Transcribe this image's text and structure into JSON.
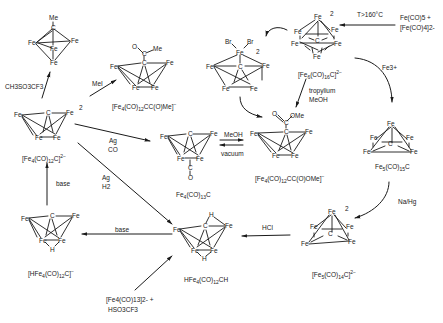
{
  "diagram": {
    "compounds": [
      {
        "id": "methylidyne",
        "formula": "",
        "substituent": "Me",
        "atoms": [
          "Me",
          "C",
          "Fe",
          "Fe",
          "Fe",
          "Fe"
        ]
      },
      {
        "id": "acyl",
        "formula": "[Fe4(CO)12CC(O)Me]-",
        "atoms": [
          "O",
          "C",
          "Me",
          "C",
          "Fe",
          "Fe",
          "Fe",
          "Fe"
        ]
      },
      {
        "id": "fe4c_dianion",
        "formula": "[Fe4(CO)12C]2-",
        "charge": "2",
        "atoms": [
          "Fe",
          "C",
          "Fe",
          "Fe",
          "Fe"
        ]
      },
      {
        "id": "fe4c13",
        "formula": "Fe4(CO)13C",
        "atoms": [
          "Fe",
          "C",
          "Fe",
          "Fe",
          "Fe",
          "C",
          "O"
        ]
      },
      {
        "id": "ester",
        "formula": "[Fe4(CO)12CC(O)OMe]-",
        "atoms": [
          "O",
          "C",
          "OMe",
          "C",
          "Fe",
          "Fe",
          "Fe",
          "Fe"
        ]
      },
      {
        "id": "dibromo",
        "formula": "",
        "charge": "2",
        "atoms": [
          "Br",
          "Br",
          "Fe",
          "C",
          "Fe",
          "Fe",
          "Fe",
          "Fe"
        ]
      },
      {
        "id": "fe6c_dianion",
        "formula": "[Fe6(CO)16C]2-",
        "charge": "2",
        "atoms": [
          "Fe",
          "Fe",
          "Fe",
          "Fe",
          "Fe",
          "Fe",
          "C"
        ]
      },
      {
        "id": "fe5c15",
        "formula": "Fe5(CO)15C",
        "atoms": [
          "Fe",
          "Fe",
          "Fe",
          "Fe",
          "Fe",
          "C"
        ]
      },
      {
        "id": "fe5c14_dianion",
        "formula": "[Fe5(CO)14C]2-",
        "charge": "2",
        "atoms": [
          "Fe",
          "Fe",
          "Fe",
          "Fe",
          "Fe",
          "C"
        ]
      },
      {
        "id": "hfe4ch",
        "formula": "HFe4(CO)12CH",
        "atoms": [
          "H",
          "Fe",
          "C",
          "Fe",
          "Fe",
          "Fe",
          "H"
        ]
      },
      {
        "id": "hfe4c_anion",
        "formula": "[HFe4(CO)12C]-",
        "atoms": [
          "Fe",
          "C",
          "Fe",
          "Fe",
          "Fe",
          "H"
        ]
      }
    ],
    "reagents": {
      "triflate_methyl": "CH3SO3CF3",
      "mei": "MeI",
      "ag_co_1": "Ag",
      "ag_co_2": "CO",
      "ag_h2_1": "Ag",
      "ag_h2_2": "H2",
      "base_up": "base",
      "base_left": "base",
      "meoh": "MeOH",
      "vacuum": "vacuum",
      "tropylium_1": "tropylium",
      "tropylium_2": "MeOH",
      "temp": "T>160°C",
      "start_1": "Fe(CO)5 +",
      "start_2": "[Fe(CO)4]2-",
      "fe3": "Fe3+",
      "nahg": "Na/Hg",
      "hcl": "HCl",
      "triflic_1": "[Fe4(CO)13]2- +",
      "triflic_2": "HSO3CF3"
    }
  }
}
